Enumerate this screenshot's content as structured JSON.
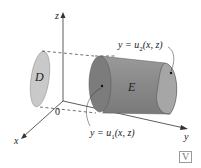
{
  "figure": {
    "axes": {
      "x_label": "x",
      "y_label": "y",
      "z_label": "z",
      "origin_label": "0"
    },
    "region_labels": {
      "projection": "D",
      "solid": "E"
    },
    "surface_labels": {
      "upper": "y = u",
      "upper_sub": "2",
      "upper_args": "(x, z)",
      "lower": "y = u",
      "lower_sub": "1",
      "lower_args": "(x, z)"
    },
    "colors": {
      "solid_fill": "#8c8c8c",
      "solid_end": "#a9a9a9",
      "projection_fill": "#c8c8c8",
      "axis": "#333333"
    },
    "badge": "V"
  }
}
